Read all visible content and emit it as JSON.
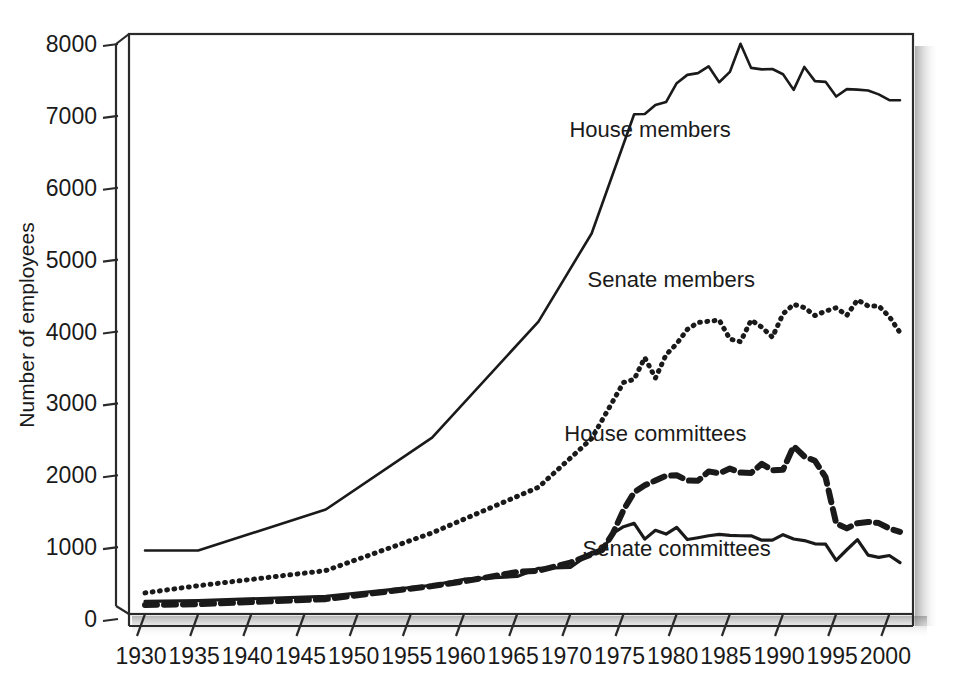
{
  "chart_data": {
    "type": "line",
    "title": "",
    "xlabel": "",
    "ylabel": "Number of employees",
    "xlim": [
      1930,
      2001
    ],
    "ylim": [
      0,
      8000
    ],
    "grid": false,
    "legend_position": "inline-annotations",
    "x_tick_labels": [
      "1930",
      "1935",
      "1940",
      "1945",
      "1950",
      "1955",
      "1960",
      "1965",
      "1970",
      "1975",
      "1980",
      "1985",
      "1990",
      "1995",
      "2000"
    ],
    "x_ticks": [
      1930,
      1935,
      1940,
      1945,
      1950,
      1955,
      1960,
      1965,
      1970,
      1975,
      1980,
      1985,
      1990,
      1995,
      2000
    ],
    "y_tick_labels": [
      "0",
      "1000",
      "2000",
      "3000",
      "4000",
      "5000",
      "6000",
      "7000",
      "8000"
    ],
    "y_ticks": [
      0,
      1000,
      2000,
      3000,
      4000,
      5000,
      6000,
      7000,
      8000
    ],
    "series": [
      {
        "name": "House members",
        "style": "solid",
        "stroke_width": 2.6,
        "dasharray": "",
        "label_x": 1977.5,
        "label_y": 6620,
        "x": [
          1930,
          1935,
          1947,
          1957,
          1967,
          1972,
          1976,
          1977,
          1978,
          1979,
          1980,
          1981,
          1982,
          1983,
          1984,
          1985,
          1986,
          1987,
          1988,
          1989,
          1990,
          1991,
          1992,
          1993,
          1994,
          1995,
          1996,
          1997,
          1998,
          1999,
          2000,
          2001
        ],
        "y": [
          870,
          870,
          1440,
          2441,
          4055,
          5280,
          6939,
          6942,
          7067,
          7109,
          7371,
          7487,
          7511,
          7606,
          7385,
          7528,
          7920,
          7584,
          7564,
          7569,
          7496,
          7278,
          7597,
          7400,
          7390,
          7186,
          7288,
          7282,
          7269,
          7216,
          7135,
          7133
        ]
      },
      {
        "name": "Senate members",
        "style": "dotted",
        "stroke_width": 5.0,
        "dasharray": "0.8 6.5",
        "label_x": 1979.5,
        "label_y": 4530,
        "x": [
          1930,
          1935,
          1947,
          1957,
          1967,
          1972,
          1975,
          1976,
          1977,
          1978,
          1979,
          1980,
          1981,
          1982,
          1983,
          1984,
          1985,
          1986,
          1987,
          1988,
          1989,
          1990,
          1991,
          1992,
          1993,
          1994,
          1995,
          1996,
          1997,
          1998,
          1999,
          2000,
          2001
        ],
        "y": [
          280,
          380,
          590,
          1115,
          1749,
          2426,
          3207,
          3251,
          3554,
          3268,
          3593,
          3746,
          3945,
          4041,
          4059,
          4075,
          3812,
          3774,
          4075,
          3977,
          3837,
          4162,
          4294,
          4249,
          4138,
          4200,
          4247,
          4141,
          4357,
          4272,
          4272,
          4123,
          3900
        ]
      },
      {
        "name": "House committees",
        "style": "dashed",
        "stroke_width": 6.0,
        "dasharray": "12 7",
        "label_x": 1978.0,
        "label_y": 2400,
        "x": [
          1930,
          1935,
          1947,
          1957,
          1960,
          1965,
          1967,
          1970,
          1972,
          1973,
          1974,
          1975,
          1976,
          1977,
          1978,
          1979,
          1980,
          1981,
          1982,
          1983,
          1984,
          1985,
          1986,
          1987,
          1988,
          1989,
          1990,
          1991,
          1992,
          1993,
          1994,
          1995,
          1996,
          1997,
          1998,
          1999,
          2000,
          2001
        ],
        "y": [
          112,
          122,
          193,
          375,
          440,
          571,
          589,
          702,
          817,
          878,
          1107,
          1433,
          1680,
          1776,
          1844,
          1909,
          1917,
          1843,
          1839,
          1970,
          1944,
          2009,
          1954,
          1949,
          2075,
          1986,
          1993,
          2321,
          2178,
          2118,
          1889,
          1246,
          1177,
          1250,
          1267,
          1251,
          1176,
          1128
        ]
      },
      {
        "name": "Senate committees",
        "style": "solid",
        "stroke_width": 3.2,
        "dasharray": "",
        "label_x": 1980.0,
        "label_y": 790,
        "x": [
          1930,
          1935,
          1947,
          1957,
          1960,
          1965,
          1967,
          1970,
          1972,
          1973,
          1974,
          1975,
          1976,
          1977,
          1978,
          1979,
          1980,
          1981,
          1982,
          1983,
          1984,
          1985,
          1986,
          1987,
          1988,
          1989,
          1990,
          1991,
          1992,
          1993,
          1994,
          1995,
          1996,
          1997,
          1998,
          1999,
          2000,
          2001
        ],
        "y": [
          163,
          172,
          232,
          386,
          470,
          509,
          621,
          635,
          844,
          873,
          1107,
          1201,
          1247,
          1028,
          1151,
          1098,
          1191,
          1022,
          1047,
          1075,
          1095,
          1080,
          1075,
          1074,
          1013,
          1013,
          1090,
          1030,
          1008,
          963,
          958,
          732,
          880,
          1020,
          805,
          774,
          800,
          700
        ]
      }
    ]
  },
  "axis": {
    "ylabel": "Number of employees"
  }
}
